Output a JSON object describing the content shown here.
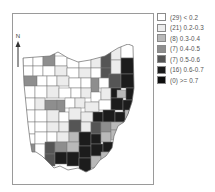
{
  "map": {
    "region": "Ohio counties",
    "north_label": "N",
    "colors": {
      "c0": "#ffffff",
      "c1": "#ececec",
      "c2": "#b9b9b9",
      "c3": "#8e8e8e",
      "c4": "#555555",
      "c5": "#1c1c1c",
      "c6": "#0e0e0e"
    }
  },
  "legend": {
    "items": [
      {
        "count": "(29)",
        "range": "< 0.2",
        "label": "(29) < 0.2",
        "color": "#ffffff"
      },
      {
        "count": "(21)",
        "range": "0.2-0.3",
        "label": "(21) 0.2-0.3",
        "color": "#ececec"
      },
      {
        "count": "(8)",
        "range": "0.3-0.4",
        "label": "(8)  0.3-0.4",
        "color": "#b9b9b9"
      },
      {
        "count": "(7)",
        "range": "0.4-0.5",
        "label": "(7)  0.4-0.5",
        "color": "#8e8e8e"
      },
      {
        "count": "(7)",
        "range": "0.5-0.6",
        "label": "(7)  0.5-0.6",
        "color": "#555555"
      },
      {
        "count": "(16)",
        "range": "0.6-0.7",
        "label": "(16) 0.6-0.7",
        "color": "#1c1c1c"
      },
      {
        "count": "(0)",
        "range": ">= 0.7",
        "label": "(0)  >= 0.7",
        "color": "#0e0e0e"
      }
    ]
  }
}
